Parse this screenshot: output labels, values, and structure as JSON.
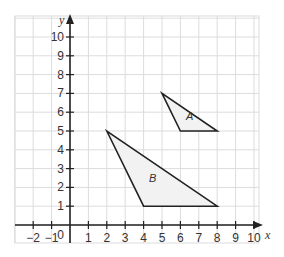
{
  "chart_data": {
    "type": "scatter",
    "title": "",
    "xlabel": "x",
    "ylabel": "y",
    "xlim": [
      -3,
      11
    ],
    "ylim": [
      -1,
      11
    ],
    "grid": true,
    "origin_label": "0",
    "x_ticks": [
      -2,
      -1,
      1,
      2,
      3,
      4,
      5,
      6,
      7,
      8,
      9,
      10
    ],
    "x_tick_labels": [
      "−2",
      "−1",
      "1",
      "2",
      "3",
      "4",
      "5",
      "6",
      "7",
      "8",
      "9",
      "10"
    ],
    "y_ticks": [
      1,
      2,
      3,
      4,
      5,
      6,
      7,
      8,
      9,
      10
    ],
    "y_tick_labels": [
      "1",
      "2",
      "3",
      "4",
      "5",
      "6",
      "7",
      "8",
      "9",
      "10"
    ],
    "shapes": [
      {
        "name": "A",
        "type": "triangle",
        "vertices": [
          [
            5,
            7
          ],
          [
            6,
            5
          ],
          [
            8,
            5
          ]
        ],
        "label_pos": [
          6.3,
          5.6
        ]
      },
      {
        "name": "B",
        "type": "triangle",
        "vertices": [
          [
            2,
            5
          ],
          [
            4,
            1
          ],
          [
            8,
            1
          ]
        ],
        "label_pos": [
          4.3,
          2.3
        ]
      }
    ]
  },
  "colors": {
    "grid": "#dcdcdc",
    "axis": "#222222",
    "shape_stroke": "#222222",
    "shape_fill": "#f2f2f2"
  }
}
